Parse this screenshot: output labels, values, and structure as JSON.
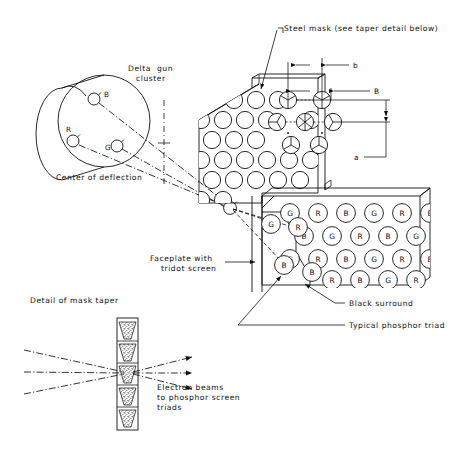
{
  "figure": {
    "background": "#ffffff",
    "ink": "#111111"
  },
  "labels": {
    "delta_gun_cluster": "Delta gun\ncluster",
    "delta_gun_cluster_line1": "Delta  gun",
    "delta_gun_cluster_line2": "cluster",
    "center_of_deflection": "Center of deflection",
    "steel_mask": "Steel mask (see taper detail below)",
    "faceplate_line1": "Faceplate with",
    "faceplate_line2": "tridot screen",
    "black_surround": "Black surround",
    "typical_phosphor_triad": "Typical phosphor triad",
    "detail_of_mask_taper": "Detail of mask taper",
    "electron_beams_line1": "Electron beams",
    "electron_beams_line2": "to phosphor screen",
    "electron_beams_line3": "triads"
  },
  "gun_cluster": {
    "guns": [
      {
        "id": "B",
        "label": "B",
        "cx": 94,
        "cy": 99,
        "r": 6.0,
        "label_x": 104,
        "label_y": 97
      },
      {
        "id": "R",
        "label": "R",
        "cx": 73,
        "cy": 141,
        "r": 6.0,
        "label_x": 68,
        "label_y": 131
      },
      {
        "id": "G",
        "label": "G",
        "cx": 117,
        "cy": 146,
        "r": 6.0,
        "label_x": 106,
        "label_y": 149
      }
    ]
  },
  "dimensions": [
    {
      "name": "b",
      "label": "b",
      "x": 357,
      "y": 70
    },
    {
      "name": "B",
      "label": "B",
      "x": 379,
      "y": 95
    },
    {
      "name": "a",
      "label": "a",
      "x": 357,
      "y": 160
    }
  ],
  "phosphor_screen": {
    "column_count": 6,
    "rows": [
      {
        "index": 0,
        "cells": [
          "G",
          "R",
          "B",
          "G",
          "R",
          "B"
        ]
      },
      {
        "index": 1,
        "cells": [
          "B",
          "G",
          "R",
          "B",
          "G",
          "R"
        ]
      },
      {
        "index": 2,
        "cells": [
          "G",
          "R",
          "B",
          "G",
          "R",
          "B"
        ]
      },
      {
        "index": 3,
        "cells": [
          "B",
          "R",
          "B",
          "G",
          "R",
          "B"
        ]
      }
    ],
    "partial_left_cells": [
      {
        "label": "G",
        "cx": 271,
        "cy": 224
      },
      {
        "label": "B",
        "cx": 284,
        "cy": 265
      }
    ],
    "colors": {
      "R": "#111111",
      "G": "#111111",
      "B": "#111111"
    }
  },
  "mask": {
    "hole_rows": 6,
    "hole_label": "mask-hole",
    "triad_holes_note": "holes with three-sector triad wedges"
  },
  "taper_detail": {
    "segments": 5,
    "beam_count": 3
  }
}
